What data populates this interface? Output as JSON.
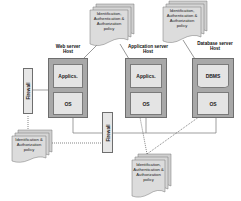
{
  "hosts": [
    {
      "id": "web",
      "label_line1": "Web server",
      "label_line2": "Host",
      "top_box": "Applics.",
      "bottom_box": "OS"
    },
    {
      "id": "app",
      "label_line1": "Application server",
      "label_line2": "Host",
      "top_box": "Applics.",
      "bottom_box": "OS"
    },
    {
      "id": "db",
      "label_line1": "Database  server",
      "label_line2": "Host",
      "top_box": "DBMS",
      "bottom_box": "OS"
    }
  ],
  "firewalls": [
    {
      "id": "firewall-1",
      "label": "Firewall"
    },
    {
      "id": "firewall-2",
      "label": "Firewall"
    }
  ],
  "policies": [
    {
      "id": "policy-web",
      "line1": "Identification,",
      "line2": "Authentication &",
      "line3": "Authorization",
      "line4": "policy"
    },
    {
      "id": "policy-db",
      "line1": "Identification,",
      "line2": "Authentication &",
      "line3": "Authorization",
      "line4": "policy"
    },
    {
      "id": "policy-firewall",
      "line1": "Identification &",
      "line2": "Authorization",
      "line3": "policy",
      "line4": ""
    },
    {
      "id": "policy-app",
      "line1": "Identification,",
      "line2": "Authentication &",
      "line3": "Authorization",
      "line4": "policy"
    }
  ],
  "colors": {
    "host_fill": "#a8a8a8",
    "inner_fill": "#e4e4e4",
    "doc_fill": "#d4d4d4",
    "line": "#555555"
  }
}
